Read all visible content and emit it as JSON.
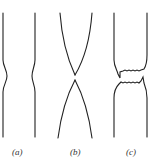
{
  "figure": {
    "panels": [
      {
        "id": "a",
        "label": "(a)",
        "description": "specimen with necking"
      },
      {
        "id": "b",
        "label": "(b)",
        "description": "specimen necked down to a point"
      },
      {
        "id": "c",
        "label": "(c)",
        "description": "specimen fractured with jagged surfaces"
      }
    ],
    "stroke_color": "#222222"
  }
}
